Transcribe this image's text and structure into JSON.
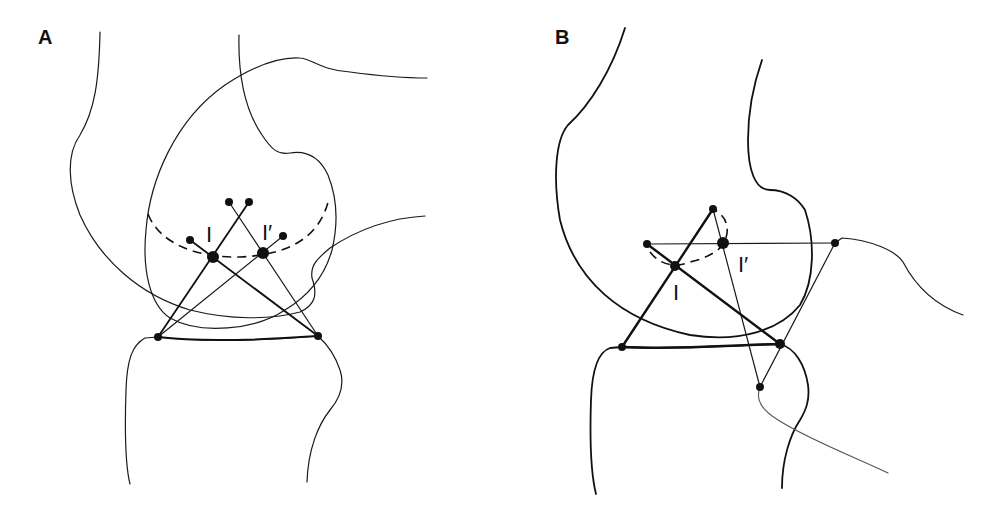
{
  "figure": {
    "panels": [
      {
        "id": "A",
        "label": "A",
        "instant_center_label": "I",
        "instant_center_prime_label": "I′",
        "description": "Knee in extension: cruciate ligaments crossing at instant center I, with prior center I′ on dashed centrode"
      },
      {
        "id": "B",
        "label": "B",
        "instant_center_label": "I",
        "instant_center_prime_label": "I′",
        "description": "Knee in flexion: crossed four-bar linkage with instant center I and I′ on short dashed centrode"
      }
    ],
    "colors": {
      "ink": "#111111",
      "background": "#ffffff",
      "gray_ink": "#555555"
    }
  }
}
